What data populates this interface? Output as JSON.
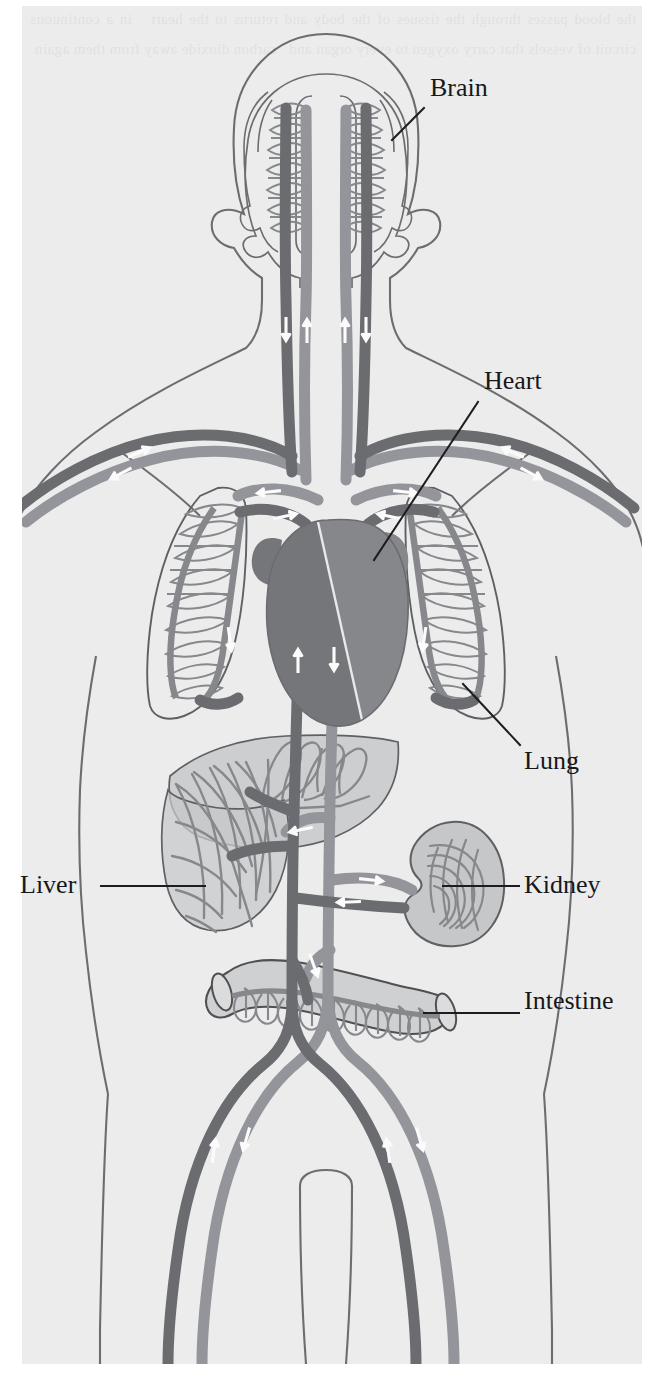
{
  "figure": {
    "kind": "anatomical-diagram",
    "orientation": "frontal-view-torso",
    "palette": {
      "page_white": "#ffffff",
      "scan_paper": "#ececed",
      "body_outline": "#6d6d70",
      "artery_gray": "#8e9094",
      "vein_gray": "#6a6c70",
      "organ_fill": "#c9cacb",
      "organ_outline": "#5f6063",
      "heart_dark": "#76787c",
      "heart_light": "#9a9ca0",
      "arrow_white": "#fbfbfb",
      "label_text": "#17171a",
      "leader_line": "#1d1d20"
    },
    "ghost_text": "the blood passes through the tissues of the body and returns to the heart   in a continuous circuit of vessels that carry oxygen to every organ and   carbon dioxide away from them again"
  },
  "labels": [
    {
      "id": "brain",
      "text": "Brain",
      "x": 430,
      "y": 75,
      "leader": {
        "x1": 424,
        "y1": 108,
        "x2": 392,
        "y2": 140
      }
    },
    {
      "id": "heart",
      "text": "Heart",
      "x": 484,
      "y": 368,
      "leader": {
        "x1": 478,
        "y1": 402,
        "x2": 374,
        "y2": 560
      }
    },
    {
      "id": "lung",
      "text": "Lung",
      "x": 524,
      "y": 748,
      "leader": {
        "x1": 520,
        "y1": 745,
        "x2": 463,
        "y2": 684
      }
    },
    {
      "id": "liver",
      "text": "Liver",
      "x": 20,
      "y": 872,
      "leader": {
        "x1": 101,
        "y1": 886,
        "x2": 205,
        "y2": 886
      }
    },
    {
      "id": "kidney",
      "text": "Kidney",
      "x": 524,
      "y": 872,
      "leader": {
        "x1": 443,
        "y1": 886,
        "x2": 519,
        "y2": 886
      }
    },
    {
      "id": "intestine",
      "text": "Intestine",
      "x": 524,
      "y": 988,
      "leader": {
        "x1": 424,
        "y1": 1013,
        "x2": 519,
        "y2": 1013
      }
    }
  ],
  "organs": [
    {
      "id": "brain",
      "name": "Brain",
      "detail": "two cerebral hemispheres with capillary beds",
      "capillary_loops": 16
    },
    {
      "id": "lung-left",
      "name": "Lung (left)",
      "detail": "alveolar capillary loops",
      "capillary_loops": 11
    },
    {
      "id": "lung-right",
      "name": "Lung (right)",
      "detail": "alveolar capillary loops",
      "capillary_loops": 11
    },
    {
      "id": "heart",
      "name": "Heart",
      "detail": "four chambers, dark right half and light left half"
    },
    {
      "id": "liver",
      "name": "Liver",
      "detail": "hepatic sinusoid network with portal supply",
      "capillary_loops": 14
    },
    {
      "id": "kidney",
      "name": "Kidney",
      "detail": "bean shape with medullary striations",
      "capillary_loops": 9
    },
    {
      "id": "intestine",
      "name": "Intestine",
      "detail": "tube with villus capillary loops",
      "capillary_loops": 11
    }
  ],
  "flow_arrows": {
    "glyph": "arrow",
    "color": "#fbfbfb",
    "description": "white directional arrows inside vessels indicating blood flow",
    "count": 22
  },
  "vessel_classes": [
    {
      "id": "artery",
      "name": "Artery (oxygenated)",
      "tone": "light-gray"
    },
    {
      "id": "vein",
      "name": "Vein (deoxygenated)",
      "tone": "dark-gray"
    }
  ]
}
